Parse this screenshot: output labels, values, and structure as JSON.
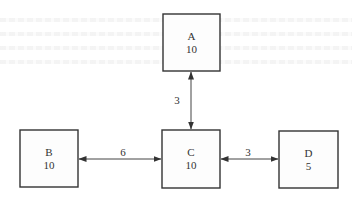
{
  "diagram": {
    "type": "network",
    "nodes": [
      {
        "id": "A",
        "name": "A",
        "value": "10"
      },
      {
        "id": "B",
        "name": "B",
        "value": "10"
      },
      {
        "id": "C",
        "name": "C",
        "value": "10"
      },
      {
        "id": "D",
        "name": "D",
        "value": "5"
      }
    ],
    "edges": [
      {
        "from": "C",
        "to": "A",
        "label": "3",
        "direction": "both"
      },
      {
        "from": "B",
        "to": "C",
        "label": "6",
        "direction": "both"
      },
      {
        "from": "C",
        "to": "D",
        "label": "3",
        "direction": "both"
      }
    ]
  }
}
